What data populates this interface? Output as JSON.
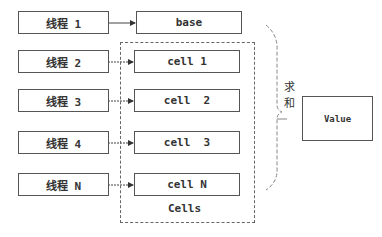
{
  "threads": [
    {
      "label": "线程 1"
    },
    {
      "label": "线程 2"
    },
    {
      "label": "线程 3"
    },
    {
      "label": "线程 4"
    },
    {
      "label": "线程 N"
    }
  ],
  "targets": [
    {
      "label": "base"
    },
    {
      "label": "cell 1"
    },
    {
      "label": "cell  2"
    },
    {
      "label": "cell  3"
    },
    {
      "label": "cell N"
    }
  ],
  "cells_group": {
    "label": "Cells"
  },
  "sum": {
    "char1": "求",
    "char2": "和"
  },
  "result": {
    "label": "Value"
  },
  "colors": {
    "stroke": "#555555",
    "dashed": "#666666",
    "text": "#333333"
  }
}
